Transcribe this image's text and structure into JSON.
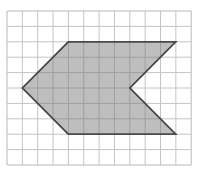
{
  "diagram": {
    "type": "grid-polygon",
    "grid": {
      "columns": 12,
      "rows": 10,
      "origin_x": 7,
      "origin_y": 11,
      "cell_w": 15.35,
      "cell_h": 15.4,
      "line_color": "#c4c4c4",
      "border_color": "#b8b8b8"
    },
    "shape": {
      "name": "chevron-arrow",
      "fill": "#b3b3b3",
      "stroke": "#4a4a4a",
      "vertices_grid": [
        [
          4,
          2
        ],
        [
          11,
          2
        ],
        [
          8,
          5
        ],
        [
          11,
          8
        ],
        [
          4,
          8
        ],
        [
          1,
          5
        ]
      ]
    }
  }
}
